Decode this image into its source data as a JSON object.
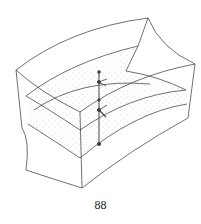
{
  "figure": {
    "colors": {
      "line": "#333333",
      "stipple": "#9a9a9a",
      "background": "#ffffff"
    }
  },
  "page_number": "88"
}
